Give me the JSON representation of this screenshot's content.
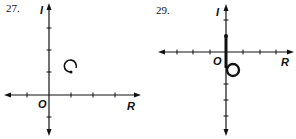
{
  "figures": [
    {
      "number": "27.",
      "axis_labels": {
        "vertical": "I",
        "horizontal": "R",
        "origin": "O"
      },
      "description": "small circular loop in first quadrant",
      "curve": "loop"
    },
    {
      "number": "29.",
      "axis_labels": {
        "vertical": "I",
        "horizontal": "R",
        "origin": "O"
      },
      "description": "thick segment on imaginary axis ending in loop below origin",
      "curve": "segment-with-loop"
    }
  ],
  "colors": {
    "ink": "#111111",
    "background": "#ffffff"
  }
}
